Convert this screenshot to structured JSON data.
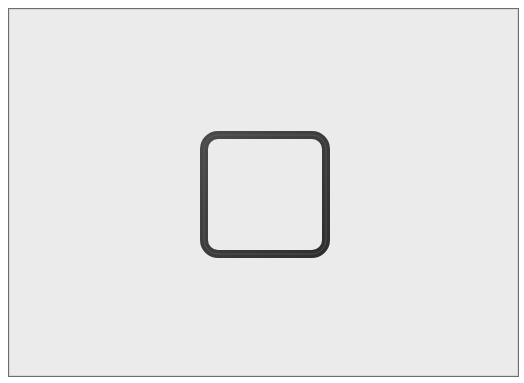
{
  "canvas": {
    "background_color": "#ebebeb",
    "border_color": "#6e6e6e"
  },
  "icon": {
    "name": "grid-icon",
    "description": "2x2 window grid",
    "stroke_color": "#3a3a3a"
  }
}
